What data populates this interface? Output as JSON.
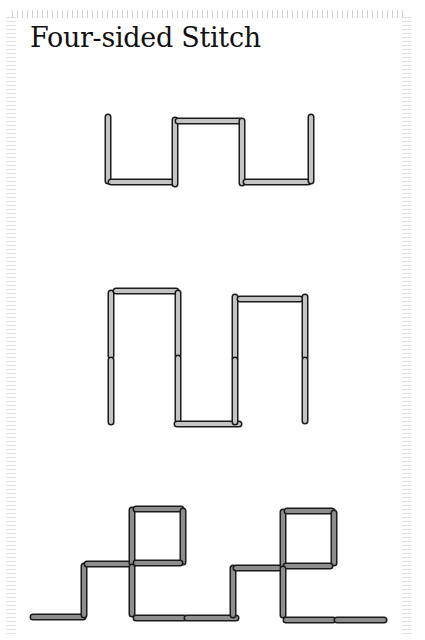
{
  "title": "Four-sided Stitch",
  "colors": {
    "stitch_fill_light": "#c4c4c4",
    "stitch_fill_dark": "#8e8e8e",
    "stitch_outline": "#1a1a1a",
    "background": "#ffffff",
    "ruler": "#cccccc"
  },
  "diagrams": [
    {
      "name": "step-1",
      "fill": "light",
      "stitches": [
        [
          108,
          117,
          108,
          181
        ],
        [
          111,
          182,
          173,
          182
        ],
        [
          175,
          120,
          175,
          184
        ],
        [
          178,
          121,
          240,
          121
        ],
        [
          242,
          121,
          242,
          183
        ],
        [
          246,
          182,
          308,
          182
        ],
        [
          311,
          117,
          311,
          181
        ]
      ]
    },
    {
      "name": "step-2",
      "fill": "light",
      "stitches": [
        [
          111,
          293,
          111,
          356
        ],
        [
          111,
          360,
          111,
          422
        ],
        [
          116,
          291,
          176,
          291
        ],
        [
          178,
          293,
          178,
          355
        ],
        [
          178,
          358,
          178,
          420
        ],
        [
          177,
          424,
          239,
          424
        ],
        [
          235,
          297,
          235,
          358
        ],
        [
          235,
          360,
          235,
          422
        ],
        [
          240,
          299,
          300,
          299
        ],
        [
          305,
          297,
          305,
          357
        ],
        [
          305,
          360,
          305,
          421
        ]
      ]
    },
    {
      "name": "step-3",
      "fill": "dark",
      "stitches": [
        [
          33,
          617,
          83,
          617
        ],
        [
          84,
          566,
          84,
          615
        ],
        [
          87,
          564,
          133,
          564
        ],
        [
          132,
          510,
          132,
          563
        ],
        [
          136,
          509,
          181,
          509
        ],
        [
          183,
          511,
          183,
          562
        ],
        [
          136,
          563,
          180,
          563
        ],
        [
          132,
          567,
          132,
          614
        ],
        [
          136,
          618,
          184,
          618
        ],
        [
          187,
          618,
          236,
          618
        ],
        [
          233,
          568,
          233,
          615
        ],
        [
          236,
          568,
          282,
          568
        ],
        [
          283,
          512,
          283,
          566
        ],
        [
          287,
          511,
          332,
          511
        ],
        [
          334,
          513,
          334,
          563
        ],
        [
          286,
          566,
          330,
          566
        ],
        [
          283,
          569,
          283,
          615
        ],
        [
          286,
          620,
          333,
          620
        ],
        [
          337,
          620,
          384,
          620
        ]
      ]
    }
  ]
}
